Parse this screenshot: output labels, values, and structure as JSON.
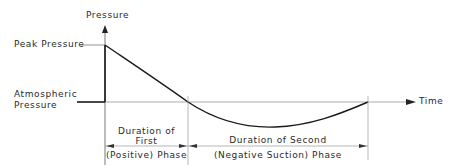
{
  "diagram": {
    "type": "blast-pressure-time-history",
    "axes": {
      "y_label": "Pressure",
      "x_label": "Time"
    },
    "levels": {
      "peak_label": "Peak Pressure",
      "atmospheric_label_line1": "Atmospheric",
      "atmospheric_label_line2": "Pressure"
    },
    "phases": {
      "first": {
        "line1": "Duration of",
        "line2": "First",
        "line3": "(Positive) Phase"
      },
      "second": {
        "line1": "Duration of Second",
        "line2": "(Negative Suction) Phase"
      }
    },
    "colors": {
      "curve": "#1a1a1a",
      "guide": "#9a9a9a",
      "text": "#2a2a2a"
    }
  }
}
